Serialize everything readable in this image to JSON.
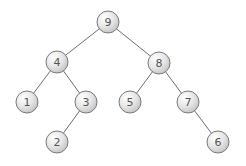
{
  "diagram": {
    "type": "binary-tree",
    "node_radius": 11,
    "colors": {
      "edge": "#6e6e6e",
      "node_border": "#7a7a7a",
      "node_fill_light": "#ffffff",
      "node_fill_dark": "#c8c8c8",
      "label": "#555555",
      "background": "#ffffff"
    },
    "nodes": [
      {
        "id": "n9",
        "label": "9",
        "x": 108,
        "y": 22
      },
      {
        "id": "n4",
        "label": "4",
        "x": 57,
        "y": 62
      },
      {
        "id": "n8",
        "label": "8",
        "x": 159,
        "y": 63
      },
      {
        "id": "n1",
        "label": "1",
        "x": 27,
        "y": 102
      },
      {
        "id": "n3",
        "label": "3",
        "x": 86,
        "y": 102
      },
      {
        "id": "n5",
        "label": "5",
        "x": 130,
        "y": 102
      },
      {
        "id": "n7",
        "label": "7",
        "x": 188,
        "y": 102
      },
      {
        "id": "n2",
        "label": "2",
        "x": 57,
        "y": 142
      },
      {
        "id": "n6",
        "label": "6",
        "x": 218,
        "y": 142
      }
    ],
    "edges": [
      {
        "from": "n9",
        "to": "n4"
      },
      {
        "from": "n9",
        "to": "n8"
      },
      {
        "from": "n4",
        "to": "n1"
      },
      {
        "from": "n4",
        "to": "n3"
      },
      {
        "from": "n3",
        "to": "n2"
      },
      {
        "from": "n8",
        "to": "n5"
      },
      {
        "from": "n8",
        "to": "n7"
      },
      {
        "from": "n7",
        "to": "n6"
      }
    ]
  }
}
